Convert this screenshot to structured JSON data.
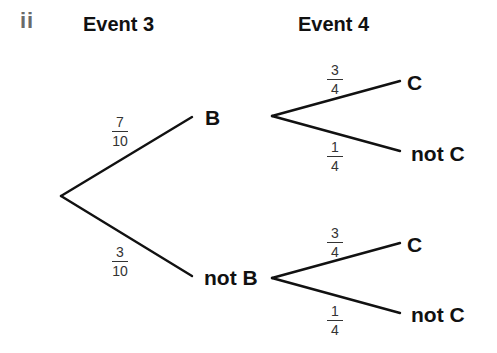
{
  "part_label": "ii",
  "headings": {
    "event3": "Event 3",
    "event4": "Event 4"
  },
  "tree": {
    "level1": [
      {
        "outcome": "B",
        "probability": {
          "numerator": "7",
          "denominator": "10"
        }
      },
      {
        "outcome": "not B",
        "probability": {
          "numerator": "3",
          "denominator": "10"
        }
      }
    ],
    "level2": {
      "after_B": [
        {
          "outcome": "C",
          "probability": {
            "numerator": "3",
            "denominator": "4"
          }
        },
        {
          "outcome": "not C",
          "probability": {
            "numerator": "1",
            "denominator": "4"
          }
        }
      ],
      "after_not_B": [
        {
          "outcome": "C",
          "probability": {
            "numerator": "3",
            "denominator": "4"
          }
        },
        {
          "outcome": "not C",
          "probability": {
            "numerator": "1",
            "denominator": "4"
          }
        }
      ]
    }
  },
  "colors": {
    "line": "#111111",
    "text": "#111111",
    "part_label": "#6a6a6a"
  }
}
